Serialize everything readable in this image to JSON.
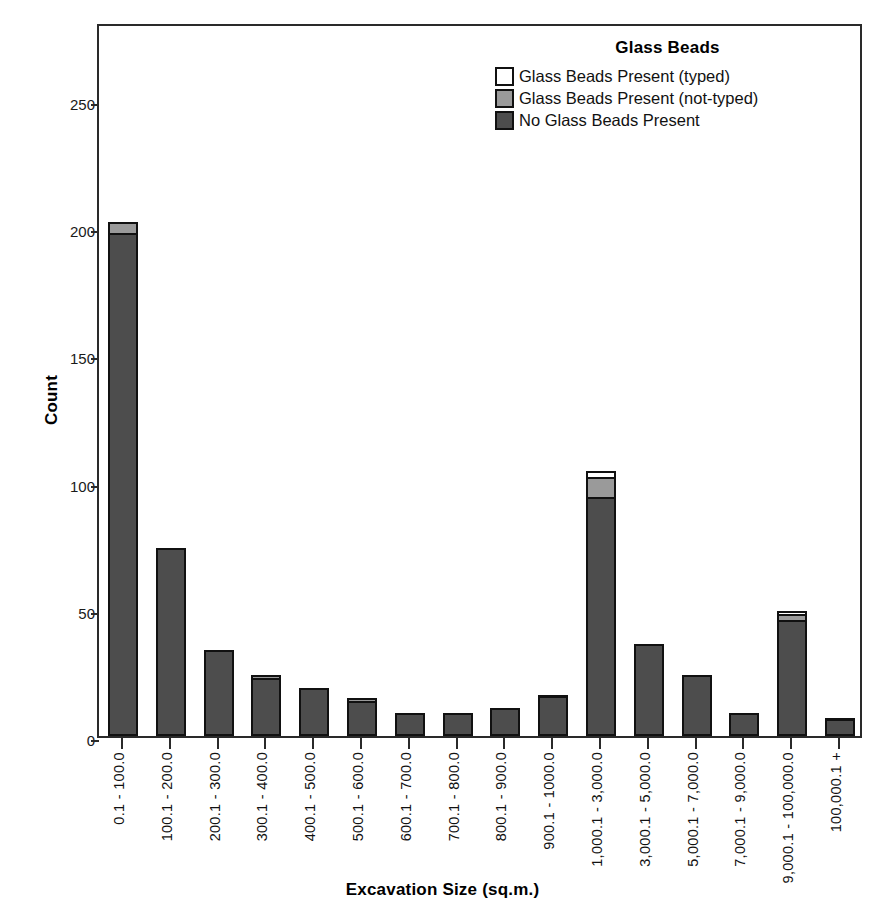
{
  "chart_data": {
    "type": "bar",
    "subtype": "stacked",
    "title": "",
    "xlabel": "Excavation Size (sq.m.)",
    "ylabel": "Count",
    "ylim": [
      0,
      280
    ],
    "yticks": [
      0,
      50,
      100,
      150,
      200,
      250
    ],
    "ytick_labels": [
      "0",
      "50",
      "100",
      "150",
      "200",
      "250"
    ],
    "grid": false,
    "legend": {
      "title": "Glass Beads",
      "position": "top-right",
      "entries": [
        {
          "label": "Glass Beads Present (typed)",
          "color": "#ffffff",
          "swatch": "white"
        },
        {
          "label": "Glass Beads Present (not-typed)",
          "color": "#9a9a9a",
          "swatch": "gray"
        },
        {
          "label": "No Glass Beads Present",
          "color": "#4d4d4d",
          "swatch": "dark"
        }
      ]
    },
    "categories": [
      "0.1 - 100.0",
      "100.1 - 200.0",
      "200.1 - 300.0",
      "300.1 - 400.0",
      "400.1 - 500.0",
      "500.1 - 600.0",
      "600.1 - 700.0",
      "700.1 - 800.0",
      "800.1 - 900.0",
      "900.1 - 1000.0",
      "1,000.1 - 3,000.0",
      "3,000.1 - 5,000.0",
      "5,000.1 - 7,000.0",
      "7,000.1 - 9,000.0",
      "9,000.1 - 100,000.0",
      "100,000.1 +"
    ],
    "series": [
      {
        "name": "No Glass Beads Present",
        "color": "#4d4d4d",
        "values": [
          197,
          74,
          34,
          22,
          19,
          13,
          9,
          9,
          11,
          15,
          93,
          36,
          24,
          9,
          45,
          6
        ]
      },
      {
        "name": "Glass Beads Present (not-typed)",
        "color": "#9a9a9a",
        "values": [
          5,
          0,
          0,
          2,
          0,
          2,
          0,
          0,
          0,
          1,
          8,
          0,
          0,
          0,
          2,
          1
        ]
      },
      {
        "name": "Glass Beads Present (typed)",
        "color": "#ffffff",
        "values": [
          0,
          0,
          0,
          0,
          0,
          0,
          0,
          0,
          0,
          0,
          3,
          0,
          0,
          0,
          2,
          0
        ]
      }
    ],
    "totals": [
      202,
      74,
      34,
      24,
      19,
      15,
      9,
      9,
      11,
      16,
      104,
      36,
      24,
      9,
      49,
      7
    ]
  }
}
